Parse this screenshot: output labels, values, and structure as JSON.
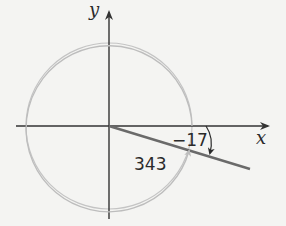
{
  "diagram": {
    "axes": {
      "x_label": "x",
      "y_label": "y"
    },
    "angles": {
      "negative": {
        "label": "−17",
        "degrees": -17
      },
      "positive": {
        "label": "343",
        "degrees": 343
      }
    },
    "colors": {
      "background": "#f4f4f2",
      "axis": "#333333",
      "terminal_side": "#6a6a6a",
      "circle": "#c4c4c4",
      "arc_positive": "#bdbdbd",
      "arc_negative": "#2a2a2a"
    }
  }
}
